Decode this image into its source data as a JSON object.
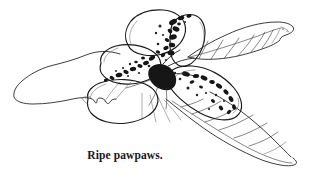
{
  "figure": {
    "domain": "Natural-Image",
    "medium": "pen-and-ink line drawing",
    "caption": "Ripe pawpaws.",
    "background_color": "#ffffff",
    "ink_color": "#1a1a1c",
    "vein_color": "#3a3a3e",
    "blotch_color": "#161617",
    "canvas": {
      "width": 314,
      "height": 181
    }
  },
  "elements": {
    "fruits": [
      {
        "name": "fruit-upper-left",
        "label": "upper left pawpaw",
        "spotted": false
      },
      {
        "name": "fruit-upper-right",
        "label": "upper right pawpaw",
        "spotted": true
      },
      {
        "name": "fruit-middle-left",
        "label": "middle left pawpaw",
        "spotted": true
      },
      {
        "name": "fruit-lower-left",
        "label": "lower left pawpaw",
        "spotted": false
      },
      {
        "name": "fruit-right-large",
        "label": "large right pawpaw",
        "spotted": true
      }
    ],
    "leaves": [
      {
        "name": "leaf-left",
        "label": "left leaf",
        "veins": 0
      },
      {
        "name": "leaf-upper-right",
        "label": "upper right leaf",
        "veins": 7
      },
      {
        "name": "leaf-lower-right",
        "label": "lower right leaf",
        "veins": 7
      }
    ],
    "stem": {
      "name": "stem-cluster",
      "label": "fruit cluster stem"
    }
  },
  "caption_block": {
    "text": "Ripe pawpaws.",
    "weight": "bold",
    "style": "serif",
    "size_px": 11.5
  }
}
